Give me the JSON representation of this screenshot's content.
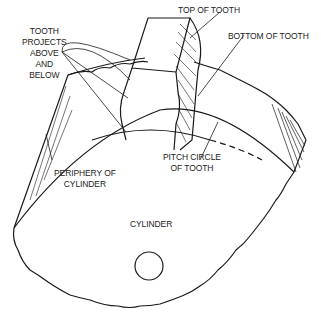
{
  "diagram": {
    "type": "technical line drawing",
    "labels": {
      "tooth_projects": [
        "TOOTH",
        "PROJECTS",
        "ABOVE",
        "AND",
        "BELOW"
      ],
      "top_of_tooth": "TOP OF TOOTH",
      "bottom_of_tooth": "BOTTOM OF TOOTH",
      "periphery": [
        "PERIPHERY OF",
        "CYLINDER"
      ],
      "pitch_circle": [
        "PITCH CIRCLE",
        "OF TOOTH"
      ],
      "cylinder": "CYLINDER"
    },
    "colors": {
      "line": "#1a1a1a",
      "background": "#ffffff"
    }
  }
}
